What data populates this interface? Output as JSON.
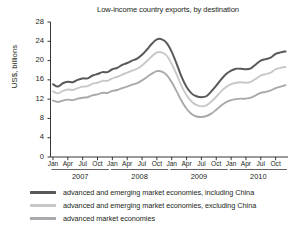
{
  "chart_data": {
    "type": "line",
    "title": "Low-income country exports, by destination",
    "xlabel": "",
    "ylabel": "US$, billions",
    "ylim": [
      0,
      28
    ],
    "ytick_values": [
      0,
      4,
      8,
      12,
      16,
      20,
      24,
      28
    ],
    "ytick_labels": [
      "0",
      "4",
      "8",
      "12",
      "16",
      "20",
      "24",
      "28"
    ],
    "grid": false,
    "legend_position": "below",
    "years": [
      "2007",
      "2008",
      "2009",
      "2010"
    ],
    "month_ticks": [
      "Jan",
      "Apr",
      "Jul",
      "Oct"
    ],
    "x": [
      "2007-01",
      "2007-02",
      "2007-03",
      "2007-04",
      "2007-05",
      "2007-06",
      "2007-07",
      "2007-08",
      "2007-09",
      "2007-10",
      "2007-11",
      "2007-12",
      "2008-01",
      "2008-02",
      "2008-03",
      "2008-04",
      "2008-05",
      "2008-06",
      "2008-07",
      "2008-08",
      "2008-09",
      "2008-10",
      "2008-11",
      "2008-12",
      "2009-01",
      "2009-02",
      "2009-03",
      "2009-04",
      "2009-05",
      "2009-06",
      "2009-07",
      "2009-08",
      "2009-09",
      "2009-10",
      "2009-11",
      "2009-12",
      "2010-01",
      "2010-02",
      "2010-03",
      "2010-04",
      "2010-05",
      "2010-06",
      "2010-07",
      "2010-08",
      "2010-09",
      "2010-10",
      "2010-11",
      "2010-12"
    ],
    "series": [
      {
        "name": "advanced and emerging market economies, including China",
        "color": "#58595b",
        "values": [
          15.1,
          14.6,
          15.3,
          15.6,
          15.5,
          16.0,
          16.3,
          16.3,
          16.9,
          17.2,
          17.6,
          17.6,
          18.2,
          18.5,
          19.1,
          19.5,
          20.0,
          20.4,
          21.2,
          22.3,
          23.5,
          24.4,
          24.4,
          23.6,
          21.8,
          19.3,
          16.6,
          14.5,
          13.2,
          12.6,
          12.4,
          12.6,
          13.6,
          14.8,
          16.1,
          17.2,
          17.9,
          18.3,
          18.3,
          18.2,
          18.4,
          19.2,
          20.0,
          20.3,
          20.6,
          21.4,
          21.7,
          21.9
        ]
      },
      {
        "name": "advanced and emerging market economies, excluding China",
        "color": "#c7c8ca",
        "values": [
          13.6,
          13.2,
          13.7,
          14.0,
          13.9,
          14.3,
          14.6,
          14.7,
          15.2,
          15.4,
          15.8,
          15.8,
          16.3,
          16.6,
          17.1,
          17.5,
          17.9,
          18.3,
          19.0,
          19.9,
          20.9,
          21.7,
          21.7,
          21.0,
          19.3,
          17.1,
          14.7,
          12.8,
          11.5,
          10.8,
          10.5,
          10.7,
          11.5,
          12.5,
          13.6,
          14.5,
          15.1,
          15.4,
          15.5,
          15.4,
          15.6,
          16.2,
          16.9,
          17.2,
          17.5,
          18.2,
          18.5,
          18.7
        ]
      },
      {
        "name": "advanced market economies",
        "color": "#a7a9ac",
        "values": [
          11.7,
          11.4,
          11.7,
          11.9,
          11.8,
          12.1,
          12.3,
          12.4,
          12.8,
          13.0,
          13.3,
          13.3,
          13.7,
          13.9,
          14.3,
          14.6,
          15.0,
          15.3,
          15.9,
          16.6,
          17.3,
          17.8,
          17.7,
          17.0,
          15.5,
          13.6,
          11.6,
          10.0,
          8.9,
          8.4,
          8.3,
          8.5,
          9.0,
          9.8,
          10.7,
          11.4,
          11.8,
          12.0,
          12.1,
          12.1,
          12.3,
          12.8,
          13.3,
          13.5,
          13.8,
          14.3,
          14.6,
          14.9
        ]
      }
    ]
  }
}
